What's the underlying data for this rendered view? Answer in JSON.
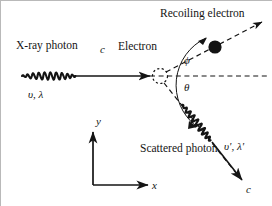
{
  "figure": {
    "background_color": "#ffffff",
    "line_color": "#141414",
    "frame_color": "#b9b9b9"
  },
  "labels": {
    "xray_photon": "X-ray photon",
    "incident_speed": "c",
    "incident_freq_wavelength": "υ, λ",
    "electron": "Electron",
    "recoiling_electron": "Recoiling electron",
    "angle_phi": "ϕ",
    "angle_theta": "θ",
    "scattered_photon": "Scattered photon",
    "scattered_freq_wavelength": "υ', λ'",
    "scattered_speed": "c",
    "axis_y": "y",
    "axis_x": "x"
  },
  "geometry": {
    "electron_x": 160,
    "electron_y": 76,
    "incident_arrow_start_x": 22,
    "incident_arrow_end_x": 152,
    "incident_y": 76,
    "recoil_angle_deg": 28,
    "scatter_angle_deg": 52,
    "axis_origin_x": 93,
    "axis_origin_y": 185,
    "axis_y_top": 130,
    "axis_x_right": 152
  }
}
